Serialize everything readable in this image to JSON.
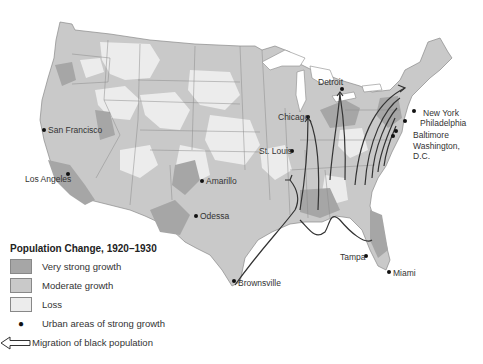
{
  "legend": {
    "title": "Population Change, 1920–1930",
    "items": [
      {
        "label": "Very strong growth",
        "color": "#a6a6a6"
      },
      {
        "label": "Moderate growth",
        "color": "#c9c9c9"
      },
      {
        "label": "Loss",
        "color": "#ececec"
      }
    ],
    "dot_label": "Urban areas of strong growth",
    "arrow_label": "Migration of black population"
  },
  "cities": [
    {
      "name": "San Francisco"
    },
    {
      "name": "Los Angeles"
    },
    {
      "name": "Amarillo"
    },
    {
      "name": "Odessa"
    },
    {
      "name": "Brownsville"
    },
    {
      "name": "St. Louis"
    },
    {
      "name": "Chicago"
    },
    {
      "name": "Detroit"
    },
    {
      "name": "New York"
    },
    {
      "name": "Philadelphia"
    },
    {
      "name": "Baltimore"
    },
    {
      "name": "Washington,"
    },
    {
      "name": "D.C."
    },
    {
      "name": "Tampa"
    },
    {
      "name": "Miami"
    }
  ]
}
